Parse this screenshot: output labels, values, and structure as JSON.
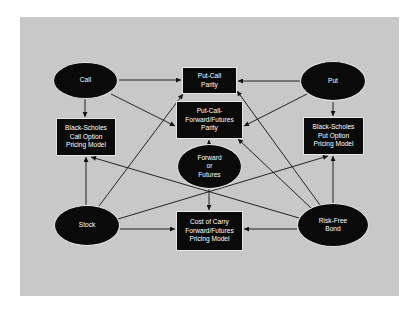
{
  "diagram": {
    "colors": {
      "panel": "#c8c8c8",
      "node_fill": "#0a0a0a",
      "node_text": "#ffffff",
      "edge": "#111111",
      "page": "#ffffff"
    },
    "nodes": {
      "call": {
        "label": "Call",
        "shape": "ellipse"
      },
      "put": {
        "label": "Put",
        "shape": "ellipse"
      },
      "stock": {
        "label": "Stock",
        "shape": "ellipse"
      },
      "bond": {
        "label": "Risk-Free\nBond",
        "shape": "ellipse"
      },
      "forward": {
        "label": "Forward\nor\nFutures",
        "shape": "ellipse"
      },
      "pcp": {
        "label": "Put-Call\nParity",
        "shape": "box"
      },
      "pcfp": {
        "label": "Put-Call-\nForward/Futures\nParity",
        "shape": "box"
      },
      "bs_call": {
        "label": "Black-Scholes\nCall Option\nPricing Model",
        "shape": "box"
      },
      "bs_put": {
        "label": "Black-Scholes\nPut Option\nPricing Model",
        "shape": "box"
      },
      "coc": {
        "label": "Cost of Carry\nForward/Futures\nPricing Model",
        "shape": "box"
      }
    },
    "edges": [
      [
        "Call",
        "Put-Call Parity"
      ],
      [
        "Call",
        "Put-Call-Forward/Futures Parity"
      ],
      [
        "Call",
        "Black-Scholes Call Option Pricing Model"
      ],
      [
        "Put",
        "Put-Call Parity"
      ],
      [
        "Put",
        "Put-Call-Forward/Futures Parity"
      ],
      [
        "Put",
        "Black-Scholes Put Option Pricing Model"
      ],
      [
        "Stock",
        "Black-Scholes Call Option Pricing Model"
      ],
      [
        "Stock",
        "Put-Call Parity"
      ],
      [
        "Stock",
        "Black-Scholes Put Option Pricing Model"
      ],
      [
        "Stock",
        "Cost of Carry Forward/Futures Pricing Model"
      ],
      [
        "Risk-Free Bond",
        "Black-Scholes Put Option Pricing Model"
      ],
      [
        "Risk-Free Bond",
        "Put-Call Parity"
      ],
      [
        "Risk-Free Bond",
        "Put-Call-Forward/Futures Parity"
      ],
      [
        "Risk-Free Bond",
        "Black-Scholes Call Option Pricing Model"
      ],
      [
        "Risk-Free Bond",
        "Cost of Carry Forward/Futures Pricing Model"
      ],
      [
        "Forward or Futures",
        "Put-Call-Forward/Futures Parity"
      ],
      [
        "Forward or Futures",
        "Cost of Carry Forward/Futures Pricing Model"
      ]
    ]
  }
}
